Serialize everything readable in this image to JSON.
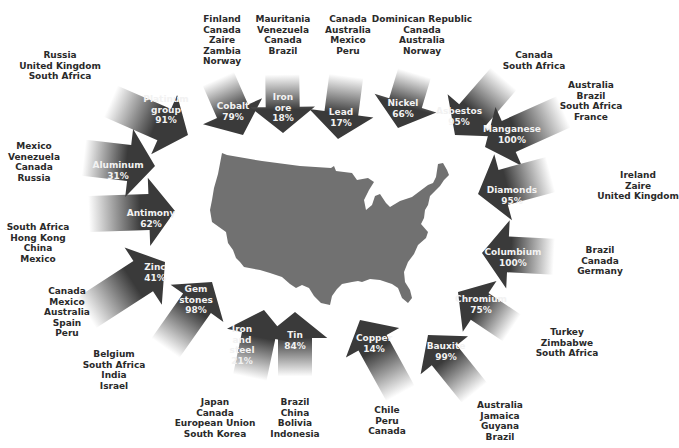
{
  "diagram": {
    "colors": {
      "arrow_dark": "#3a3a3a",
      "arrow_light": "#ffffff",
      "map_fill": "#707070",
      "label_text": "#f2f2f2",
      "source_text": "#2a2a2a"
    },
    "map": {
      "label": "United States",
      "icon": "us-map"
    },
    "minerals": [
      {
        "name": "Platinum group",
        "lines": [
          "Platinum",
          "group",
          "91%"
        ],
        "percent": "91%",
        "sources": [
          "Russia",
          "United Kingdom",
          "South Africa"
        ]
      },
      {
        "name": "Cobalt",
        "lines": [
          "Cobalt",
          "79%"
        ],
        "percent": "79%",
        "sources": [
          "Finland",
          "Canada",
          "Zaire",
          "Zambia",
          "Norway"
        ]
      },
      {
        "name": "Iron ore",
        "lines": [
          "Iron",
          "ore",
          "18%"
        ],
        "percent": "18%",
        "sources": [
          "Mauritania",
          "Venezuela",
          "Canada",
          "Brazil"
        ]
      },
      {
        "name": "Lead",
        "lines": [
          "Lead",
          "17%"
        ],
        "percent": "17%",
        "sources": [
          "Canada",
          "Australia",
          "Mexico",
          "Peru"
        ]
      },
      {
        "name": "Nickel",
        "lines": [
          "Nickel",
          "66%"
        ],
        "percent": "66%",
        "sources": [
          "Dominican Republic",
          "Canada",
          "Australia",
          "Norway"
        ]
      },
      {
        "name": "Asbestos",
        "lines": [
          "Asbestos",
          "95%"
        ],
        "percent": "95%",
        "sources": [
          "Canada",
          "South Africa"
        ]
      },
      {
        "name": "Manganese",
        "lines": [
          "Manganese",
          "100%"
        ],
        "percent": "100%",
        "sources": [
          "Australia",
          "Brazil",
          "South Africa",
          "France"
        ]
      },
      {
        "name": "Diamonds",
        "lines": [
          "Diamonds",
          "95%"
        ],
        "percent": "95%",
        "sources": [
          "Ireland",
          "Zaire",
          "United Kingdom"
        ]
      },
      {
        "name": "Columbium",
        "lines": [
          "Columbium",
          "100%"
        ],
        "percent": "100%",
        "sources": [
          "Brazil",
          "Canada",
          "Germany"
        ]
      },
      {
        "name": "Chromium",
        "lines": [
          "Chromium",
          "75%"
        ],
        "percent": "75%",
        "sources": [
          "Turkey",
          "Zimbabwe",
          "South Africa"
        ]
      },
      {
        "name": "Bauxite",
        "lines": [
          "Bauxite",
          "99%"
        ],
        "percent": "99%",
        "sources": [
          "Australia",
          "Jamaica",
          "Guyana",
          "Brazil"
        ]
      },
      {
        "name": "Copper",
        "lines": [
          "Copper",
          "14%"
        ],
        "percent": "14%",
        "sources": [
          "Chile",
          "Peru",
          "Canada"
        ]
      },
      {
        "name": "Tin",
        "lines": [
          "Tin",
          "84%"
        ],
        "percent": "84%",
        "sources": [
          "Brazil",
          "China",
          "Bolivia",
          "Indonesia"
        ]
      },
      {
        "name": "Iron and steel",
        "lines": [
          "Iron",
          "and",
          "steel",
          "21%"
        ],
        "percent": "21%",
        "sources": [
          "Japan",
          "Canada",
          "European Union",
          "South Korea"
        ]
      },
      {
        "name": "Gem stones",
        "lines": [
          "Gem",
          "stones",
          "98%"
        ],
        "percent": "98%",
        "sources": [
          "Belgium",
          "South Africa",
          "India",
          "Israel"
        ]
      },
      {
        "name": "Zinc",
        "lines": [
          "Zinc",
          "41%"
        ],
        "percent": "41%",
        "sources": [
          "Canada",
          "Mexico",
          "Australia",
          "Spain",
          "Peru"
        ]
      },
      {
        "name": "Antimony",
        "lines": [
          "Antimony",
          "62%"
        ],
        "percent": "62%",
        "sources": [
          "South Africa",
          "Hong Kong",
          "China",
          "Mexico"
        ]
      },
      {
        "name": "Aluminum",
        "lines": [
          "Aluminum",
          "31%"
        ],
        "percent": "31%",
        "sources": [
          "Mexico",
          "Venezuela",
          "Canada",
          "Russia"
        ]
      }
    ]
  }
}
